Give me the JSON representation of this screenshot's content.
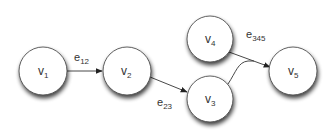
{
  "diagram": {
    "type": "hypergraph",
    "colors": {
      "background": "#ffffff",
      "node_fill": "#ffffff",
      "node_stroke": "#3a3a3a",
      "node_shadow": "#000000",
      "edge": "#333333",
      "text": "#333333"
    },
    "nodes": [
      {
        "id": "v1",
        "base": "v",
        "sub": "1",
        "cx": 43,
        "cy": 71,
        "r": 24
      },
      {
        "id": "v2",
        "base": "v",
        "sub": "2",
        "cx": 127,
        "cy": 71,
        "r": 24
      },
      {
        "id": "v3",
        "base": "v",
        "sub": "3",
        "cx": 210,
        "cy": 99,
        "r": 23
      },
      {
        "id": "v4",
        "base": "v",
        "sub": "4",
        "cx": 210,
        "cy": 39,
        "r": 23
      },
      {
        "id": "v5",
        "base": "v",
        "sub": "5",
        "cx": 293,
        "cy": 71,
        "r": 24
      }
    ],
    "edges": [
      {
        "id": "e12",
        "base": "e",
        "sub": "12",
        "from": [
          "v1"
        ],
        "to": "v2",
        "label_x": 74,
        "label_y": 62
      },
      {
        "id": "e23",
        "base": "e",
        "sub": "23",
        "from": [
          "v2"
        ],
        "to": "v3",
        "label_x": 157,
        "label_y": 108
      },
      {
        "id": "e345",
        "base": "e",
        "sub": "345",
        "from": [
          "v3",
          "v4"
        ],
        "to": "v5",
        "label_x": 245,
        "label_y": 39
      }
    ]
  }
}
